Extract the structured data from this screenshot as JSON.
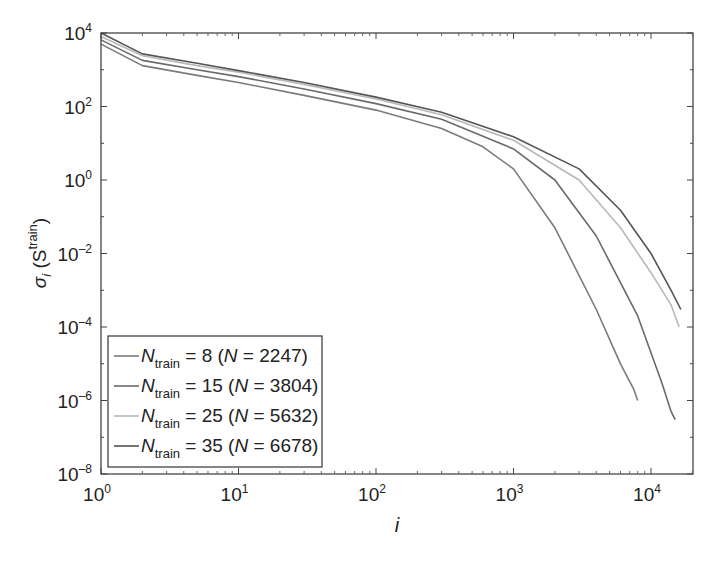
{
  "chart_data": {
    "type": "line",
    "title": "",
    "xlabel": "i",
    "ylabel": "σ_i (S^train)",
    "xscale": "log",
    "yscale": "log",
    "xlim": [
      1,
      20000
    ],
    "ylim": [
      1e-08,
      10000.0
    ],
    "grid": false,
    "legend_position": "lower left",
    "x_ticks": [
      "10^0",
      "10^1",
      "10^2",
      "10^3",
      "10^4"
    ],
    "y_ticks": [
      "10^-8",
      "10^-6",
      "10^-4",
      "10^-2",
      "10^0",
      "10^2",
      "10^4"
    ],
    "series": [
      {
        "name": "N_train = 8 (N = 2247)",
        "color": "#7a7a7a",
        "x": [
          1,
          2,
          5,
          10,
          30,
          100,
          300,
          600,
          1000,
          2000,
          4000,
          6000,
          7500,
          8000
        ],
        "values": [
          5000,
          1300,
          700,
          450,
          200,
          80,
          25,
          8,
          2,
          0.05,
          0.0003,
          1e-05,
          2e-06,
          1e-06
        ]
      },
      {
        "name": "N_train = 15 (N = 3804)",
        "color": "#6a6a6a",
        "x": [
          1,
          2,
          5,
          10,
          30,
          100,
          300,
          1000,
          2000,
          4000,
          8000,
          12000,
          14000,
          15000
        ],
        "values": [
          6500,
          1800,
          1000,
          650,
          300,
          120,
          45,
          7,
          1,
          0.03,
          0.0002,
          3e-06,
          5e-07,
          3e-07
        ]
      },
      {
        "name": "N_train = 25 (N = 5632)",
        "color": "#b8b8b8",
        "x": [
          1,
          2,
          5,
          10,
          30,
          100,
          300,
          1000,
          3000,
          6000,
          10000,
          14000,
          16000
        ],
        "values": [
          8000,
          2400,
          1300,
          850,
          400,
          160,
          60,
          12,
          1,
          0.05,
          0.003,
          0.0004,
          0.0001
        ]
      },
      {
        "name": "N_train = 35 (N = 6678)",
        "color": "#555555",
        "x": [
          1,
          2,
          5,
          10,
          30,
          100,
          300,
          1000,
          3000,
          6000,
          10000,
          14000,
          16500
        ],
        "values": [
          10000,
          2700,
          1500,
          950,
          450,
          180,
          70,
          15,
          2,
          0.15,
          0.01,
          0.001,
          0.0003
        ]
      }
    ]
  },
  "axes": {
    "x_tick_labels": [
      {
        "base": "10",
        "exp": "0"
      },
      {
        "base": "10",
        "exp": "1"
      },
      {
        "base": "10",
        "exp": "2"
      },
      {
        "base": "10",
        "exp": "3"
      },
      {
        "base": "10",
        "exp": "4"
      }
    ],
    "y_tick_labels": [
      {
        "base": "10",
        "exp": "4"
      },
      {
        "base": "10",
        "exp": "2"
      },
      {
        "base": "10",
        "exp": "0"
      },
      {
        "base": "10",
        "exp": "-2"
      },
      {
        "base": "10",
        "exp": "-4"
      },
      {
        "base": "10",
        "exp": "-6"
      },
      {
        "base": "10",
        "exp": "-8"
      }
    ],
    "xlabel": "i",
    "ylabel_main": "σ",
    "ylabel_sub": "i",
    "ylabel_paren": "(S",
    "ylabel_sup": "train",
    "ylabel_close": ")"
  },
  "legend": {
    "entries": [
      {
        "symbol": "N",
        "sub": "train",
        "rest": " = 8 (",
        "n": "N",
        "tail": " = 2247)"
      },
      {
        "symbol": "N",
        "sub": "train",
        "rest": " = 15 (",
        "n": "N",
        "tail": " = 3804)"
      },
      {
        "symbol": "N",
        "sub": "train",
        "rest": " = 25 (",
        "n": "N",
        "tail": " = 5632)"
      },
      {
        "symbol": "N",
        "sub": "train",
        "rest": " = 35 (",
        "n": "N",
        "tail": " = 6678)"
      }
    ]
  }
}
